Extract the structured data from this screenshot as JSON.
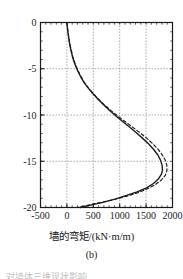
{
  "figure": {
    "caption": "(b)",
    "bottom_text_fragment": "对墙体三维现状影响"
  },
  "chart_data": {
    "type": "line",
    "title": "",
    "subtitle": "",
    "xlabel": "墙的弯矩/(kN·m/m)",
    "ylabel": "",
    "xlim": [
      -500,
      2000
    ],
    "ylim": [
      -20,
      0
    ],
    "xticks": [
      -500,
      0,
      500,
      1000,
      1500,
      2000
    ],
    "yticks": [
      0,
      -5,
      -10,
      -15,
      -20
    ],
    "xtick_labels": [
      "-500",
      "0",
      "500",
      "1000",
      "1500",
      "2000"
    ],
    "ytick_labels": [
      "0",
      "-5",
      "-10",
      "-15",
      "-20"
    ],
    "x_minor_tick_step": 100,
    "y_minor_tick_step": 1,
    "grid": true,
    "grid_style": "dotted",
    "grid_color": "#8c8c8c",
    "legend": "none",
    "legend_position": "none",
    "axis_color": "#1a1a1a",
    "note": "Depth (m) on vertical axis, bending moment on horizontal axis; curves plotted as moment(x) versus depth(y).",
    "series": [
      {
        "name": "solid-curve",
        "style": "solid",
        "color": "#1a1a1a",
        "points": [
          [
            0,
            0
          ],
          [
            10,
            -0.6
          ],
          [
            25,
            -1.3
          ],
          [
            45,
            -2.1
          ],
          [
            72,
            -2.9
          ],
          [
            105,
            -3.7
          ],
          [
            145,
            -4.4
          ],
          [
            195,
            -5.1
          ],
          [
            255,
            -5.8
          ],
          [
            325,
            -6.5
          ],
          [
            405,
            -7.1
          ],
          [
            495,
            -7.7
          ],
          [
            590,
            -8.3
          ],
          [
            695,
            -8.9
          ],
          [
            810,
            -9.5
          ],
          [
            930,
            -10.1
          ],
          [
            1055,
            -10.7
          ],
          [
            1185,
            -11.3
          ],
          [
            1310,
            -11.9
          ],
          [
            1430,
            -12.5
          ],
          [
            1545,
            -13.1
          ],
          [
            1640,
            -13.7
          ],
          [
            1720,
            -14.3
          ],
          [
            1775,
            -14.9
          ],
          [
            1805,
            -15.5
          ],
          [
            1810,
            -16.0
          ],
          [
            1790,
            -16.4
          ],
          [
            1735,
            -16.9
          ],
          [
            1640,
            -17.4
          ],
          [
            1500,
            -17.9
          ],
          [
            1330,
            -18.3
          ],
          [
            1130,
            -18.7
          ],
          [
            910,
            -19.1
          ],
          [
            680,
            -19.45
          ],
          [
            450,
            -19.75
          ],
          [
            255,
            -20
          ]
        ]
      },
      {
        "name": "dashed-curve",
        "style": "dashed",
        "color": "#1a1a1a",
        "points": [
          [
            0,
            0
          ],
          [
            12,
            -0.6
          ],
          [
            28,
            -1.3
          ],
          [
            50,
            -2.1
          ],
          [
            78,
            -2.9
          ],
          [
            112,
            -3.7
          ],
          [
            152,
            -4.4
          ],
          [
            202,
            -5.1
          ],
          [
            262,
            -5.8
          ],
          [
            332,
            -6.5
          ],
          [
            412,
            -7.1
          ],
          [
            502,
            -7.7
          ],
          [
            600,
            -8.3
          ],
          [
            710,
            -8.9
          ],
          [
            830,
            -9.5
          ],
          [
            960,
            -10.1
          ],
          [
            1100,
            -10.7
          ],
          [
            1240,
            -11.3
          ],
          [
            1380,
            -11.9
          ],
          [
            1510,
            -12.5
          ],
          [
            1625,
            -13.1
          ],
          [
            1725,
            -13.7
          ],
          [
            1805,
            -14.3
          ],
          [
            1865,
            -14.9
          ],
          [
            1895,
            -15.5
          ],
          [
            1895,
            -16.0
          ],
          [
            1865,
            -16.5
          ],
          [
            1795,
            -17.0
          ],
          [
            1680,
            -17.5
          ],
          [
            1520,
            -18.0
          ],
          [
            1320,
            -18.45
          ],
          [
            1090,
            -18.85
          ],
          [
            845,
            -19.2
          ],
          [
            600,
            -19.5
          ],
          [
            370,
            -19.78
          ],
          [
            185,
            -20
          ]
        ]
      }
    ]
  }
}
